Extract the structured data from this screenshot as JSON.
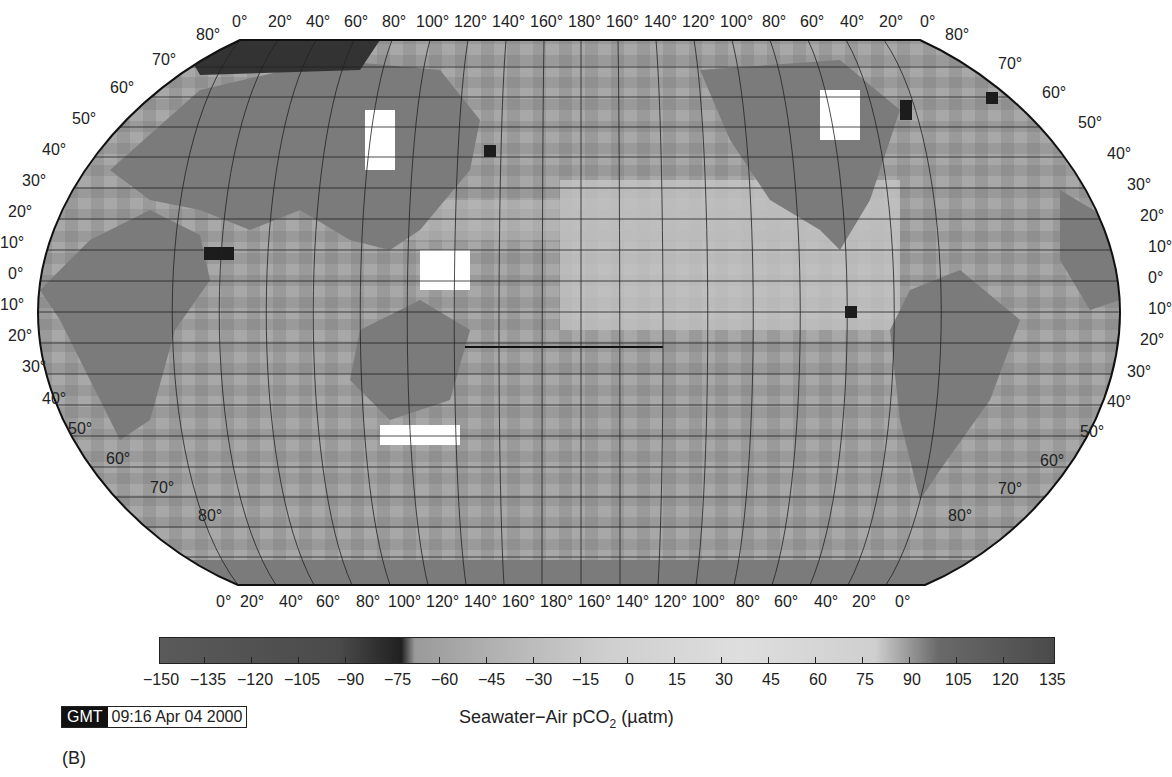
{
  "map": {
    "projection": "Robinson (Pacific-centered)",
    "top_lon_labels": [
      "0°",
      "20°",
      "40°",
      "60°",
      "80°",
      "100°",
      "120°",
      "140°",
      "160°",
      "180°",
      "160°",
      "140°",
      "120°",
      "100°",
      "80°",
      "60°",
      "40°",
      "20°",
      "0°"
    ],
    "bottom_lon_labels": [
      "0°",
      "20°",
      "40°",
      "60°",
      "80°",
      "100°",
      "120°",
      "140°",
      "160°",
      "180°",
      "160°",
      "140°",
      "120°",
      "100°",
      "80°",
      "60°",
      "40°",
      "20°",
      "0°"
    ],
    "left_lat_labels": [
      "80°",
      "70°",
      "60°",
      "50°",
      "40°",
      "30°",
      "20°",
      "10°",
      "0°",
      "10°",
      "20°",
      "30°",
      "40°",
      "50°",
      "60°",
      "70°",
      "80°"
    ],
    "right_lat_labels": [
      "80°",
      "70°",
      "60°",
      "50°",
      "40°",
      "30°",
      "20°",
      "10°",
      "0°",
      "10°",
      "20°",
      "30°",
      "40°",
      "50°",
      "60°",
      "70°",
      "80°"
    ],
    "colors": {
      "land": "#7b7b7b",
      "ocean_low": "#8e8e8e",
      "ocean_high": "#d6d6d6",
      "nodata": "#ffffff",
      "extreme": "#222222"
    }
  },
  "colorbar": {
    "ticks": [
      "−150",
      "−135",
      "−120",
      "−105",
      "−90",
      "−75",
      "−60",
      "−45",
      "−30",
      "−15",
      "0",
      "15",
      "30",
      "45",
      "60",
      "75",
      "90",
      "105",
      "120",
      "135"
    ],
    "title": "Seawater−Air pCO",
    "title_sub": "2",
    "title_units": " (µatm)"
  },
  "stamp": {
    "key": "GMT",
    "value": "09:16 Apr 04 2000"
  },
  "panel_label": "(B)"
}
